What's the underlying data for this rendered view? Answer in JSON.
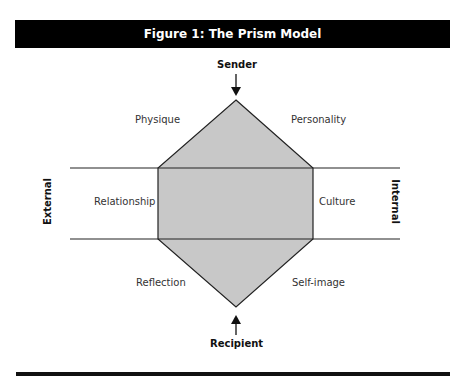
{
  "figure": {
    "title": "Figure 1: The Prism Model"
  },
  "diagram": {
    "top_label": "Sender",
    "bottom_label": "Recipient",
    "left_axis_label": "External",
    "right_axis_label": "Internal",
    "facets": {
      "top_left": "Physique",
      "top_right": "Personality",
      "middle_left": "Relationship",
      "middle_right": "Culture",
      "bottom_left": "Reflection",
      "bottom_right": "Self-image"
    },
    "colors": {
      "prism_fill": "#c8c8c8",
      "stroke": "#222222",
      "header_bg": "#000000"
    }
  }
}
